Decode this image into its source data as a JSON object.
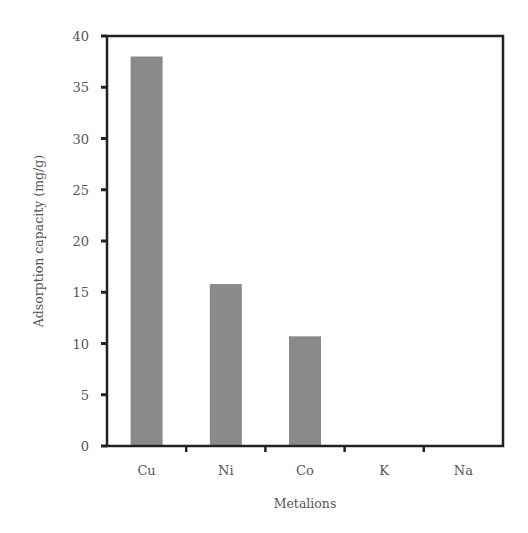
{
  "chart_data": {
    "type": "bar",
    "title": "",
    "xlabel": "Metalions",
    "ylabel": "Adsorption capacity (mg/g)",
    "categories": [
      "Cu",
      "Ni",
      "Co",
      "K",
      "Na"
    ],
    "values": [
      38.0,
      15.8,
      10.7,
      0,
      0
    ],
    "ylim": [
      0,
      40
    ],
    "yticks": [
      0,
      5,
      10,
      15,
      20,
      25,
      30,
      35,
      40
    ],
    "grid": false,
    "legend": null,
    "bar_color": "#8a8a8a",
    "axis_color": "#222222",
    "text_color": "#555555"
  }
}
